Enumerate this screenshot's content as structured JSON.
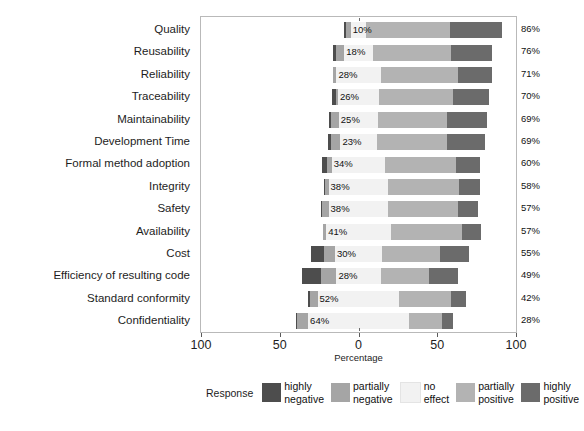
{
  "chart_data": {
    "type": "bar",
    "subtype": "diverging-stacked-bar",
    "title": "",
    "xlabel": "Percentage",
    "ylabel": "",
    "xlim": [
      -100,
      100
    ],
    "xticks": [
      -100,
      -50,
      0,
      50,
      100
    ],
    "xticklabels": [
      "100",
      "50",
      "0",
      "50",
      "100"
    ],
    "grid": false,
    "legend_position": "bottom",
    "legend_title": "Response",
    "legend_entries": [
      {
        "label_line1": "highly",
        "label_line2": "negative",
        "color": "#4d4d4d"
      },
      {
        "label_line1": "partially",
        "label_line2": "negative",
        "color": "#a5a5a5"
      },
      {
        "label_line1": "no",
        "label_line2": "effect",
        "color": "#f2f2f2"
      },
      {
        "label_line1": "partially",
        "label_line2": "positive",
        "color": "#b3b3b3"
      },
      {
        "label_line1": "highly",
        "label_line2": "positive",
        "color": "#6b6b6b"
      }
    ],
    "categories": [
      "Quality",
      "Reusability",
      "Reliability",
      "Traceability",
      "Maintainability",
      "Development Time",
      "Formal method adoption",
      "Integrity",
      "Safety",
      "Availability",
      "Cost",
      "Efficiency of resulting code",
      "Standard conformity",
      "Confidentiality"
    ],
    "series": [
      {
        "name": "highly negative",
        "color": "#4d4d4d",
        "values": [
          1,
          2,
          0,
          3,
          1,
          2,
          3,
          1,
          1,
          0,
          8,
          12,
          1,
          1
        ]
      },
      {
        "name": "partially negative",
        "color": "#a5a5a5",
        "values": [
          3,
          5,
          2,
          1,
          5,
          6,
          3,
          2,
          4,
          2,
          7,
          10,
          5,
          7
        ]
      },
      {
        "name": "no effect",
        "color": "#f2f2f2",
        "values": [
          10,
          18,
          28,
          26,
          25,
          23,
          34,
          38,
          38,
          41,
          30,
          28,
          52,
          64
        ]
      },
      {
        "name": "partially positive",
        "color": "#b3b3b3",
        "values": [
          53,
          50,
          49,
          47,
          44,
          45,
          45,
          45,
          44,
          45,
          37,
          31,
          33,
          21
        ]
      },
      {
        "name": "highly positive",
        "color": "#6b6b6b",
        "values": [
          33,
          26,
          22,
          23,
          25,
          24,
          15,
          13,
          13,
          12,
          18,
          18,
          9,
          7
        ]
      }
    ],
    "negative_totals_pct": [
      "4%",
      "7%",
      "2%",
      "4%",
      "6%",
      "8%",
      "6%",
      "3%",
      "5%",
      "2%",
      "15%",
      "22%",
      "6%",
      "8%"
    ],
    "neutral_pct": [
      "10%",
      "18%",
      "28%",
      "26%",
      "25%",
      "23%",
      "34%",
      "38%",
      "38%",
      "41%",
      "30%",
      "28%",
      "52%",
      "64%"
    ],
    "positive_totals_pct": [
      "86%",
      "76%",
      "71%",
      "70%",
      "69%",
      "69%",
      "60%",
      "58%",
      "57%",
      "57%",
      "55%",
      "49%",
      "42%",
      "28%"
    ]
  }
}
